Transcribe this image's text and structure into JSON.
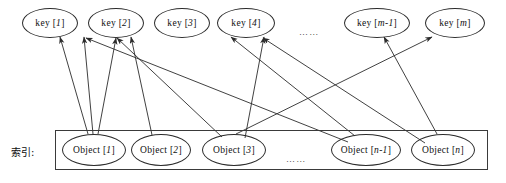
{
  "diagram": {
    "side_label": "索引:",
    "key_ellipsis": "……",
    "object_ellipsis": "……",
    "stroke_color": "#2b2b2b",
    "background_color": "#ffffff",
    "keys": [
      {
        "id": "key-1",
        "label": "key [1]",
        "cx": 50,
        "cy": 23,
        "rx": 28,
        "ry": 15
      },
      {
        "id": "key-2",
        "label": "key [2]",
        "cx": 116,
        "cy": 23,
        "rx": 28,
        "ry": 15
      },
      {
        "id": "key-3",
        "label": "key [3]",
        "cx": 182,
        "cy": 23,
        "rx": 28,
        "ry": 15
      },
      {
        "id": "key-4",
        "label": "key [4]",
        "cx": 246,
        "cy": 23,
        "rx": 29,
        "ry": 15
      },
      {
        "id": "key-m-1",
        "label": "key [m-1]",
        "cx": 377,
        "cy": 23,
        "rx": 33,
        "ry": 15
      },
      {
        "id": "key-m",
        "label": "key [m]",
        "cx": 455,
        "cy": 23,
        "rx": 30,
        "ry": 15
      }
    ],
    "objects": [
      {
        "id": "object-1",
        "label": "Object [1]",
        "cx": 94,
        "cy": 150,
        "rx": 32,
        "ry": 16
      },
      {
        "id": "object-2",
        "label": "Object [2]",
        "cx": 161,
        "cy": 150,
        "rx": 30,
        "ry": 16
      },
      {
        "id": "object-3",
        "label": "Object [3]",
        "cx": 234,
        "cy": 150,
        "rx": 32,
        "ry": 16
      },
      {
        "id": "object-n-1",
        "label": "Object [n-1]",
        "cx": 366,
        "cy": 150,
        "rx": 35,
        "ry": 16
      },
      {
        "id": "object-n",
        "label": "Object [n]",
        "cx": 443,
        "cy": 150,
        "rx": 32,
        "ry": 16
      }
    ],
    "container": {
      "x": 55,
      "y": 130,
      "width": 433,
      "height": 40
    },
    "key_ellipsis_pos": {
      "x": 299,
      "y": 27
    },
    "object_ellipsis_pos": {
      "x": 286,
      "y": 154
    },
    "side_label_pos": {
      "x": 11,
      "y": 144
    },
    "edges": [
      {
        "from": "object-1",
        "x1": 88,
        "y1": 134,
        "x2": 60,
        "y2": 37
      },
      {
        "from": "object-1",
        "x1": 93,
        "y1": 134,
        "x2": 84,
        "y2": 37
      },
      {
        "from": "object-1",
        "x1": 98,
        "y1": 134,
        "x2": 116,
        "y2": 38
      },
      {
        "from": "object-2",
        "x1": 152,
        "y1": 135,
        "x2": 131,
        "y2": 37
      },
      {
        "from": "object-3",
        "x1": 222,
        "y1": 137,
        "x2": 117,
        "y2": 38
      },
      {
        "from": "object-3",
        "x1": 236,
        "y1": 134,
        "x2": 432,
        "y2": 37
      },
      {
        "from": "object-3",
        "x1": 245,
        "y1": 138,
        "x2": 264,
        "y2": 37
      },
      {
        "from": "object-n-1",
        "x1": 355,
        "y1": 136,
        "x2": 231,
        "y2": 37
      },
      {
        "from": "object-n-1",
        "x1": 348,
        "y1": 142,
        "x2": 86,
        "y2": 38
      },
      {
        "from": "object-n",
        "x1": 437,
        "y1": 134,
        "x2": 384,
        "y2": 37
      },
      {
        "from": "object-n",
        "x1": 425,
        "y1": 143,
        "x2": 263,
        "y2": 38
      }
    ]
  }
}
